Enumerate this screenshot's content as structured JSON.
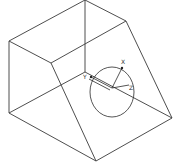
{
  "drawing": {
    "type": "wireframe-solid",
    "colors": {
      "background": "#ffffff",
      "lines": "#3a3a3a"
    },
    "axes": {
      "x_label": "X",
      "y_label": "Y",
      "z_label": "Z"
    }
  }
}
